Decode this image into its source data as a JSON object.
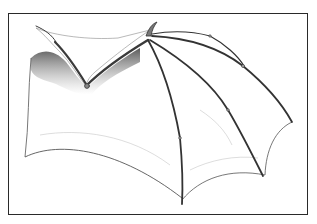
{
  "image": {
    "subject": "Pencil drawing of a membranous bat-like wing",
    "description": "Graphite illustration of a bat/dragon wing skeleton with stretched membrane, framed by a thin dark border",
    "colors": {
      "background": "#ffffff",
      "frame": "#2a2a2a",
      "bone_stroke": "#3a3a3a",
      "shadow": "#6b6b6b",
      "membrane_line": "#9a9a9a"
    }
  }
}
